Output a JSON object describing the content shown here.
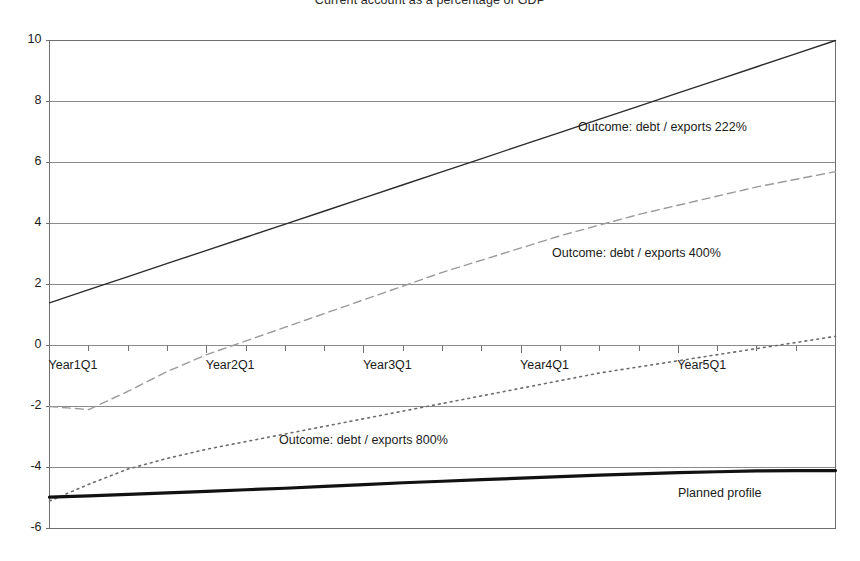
{
  "chart_data": {
    "type": "line",
    "title": "Current account as a percentage of GDP",
    "xlabel": "",
    "ylabel": "",
    "ylim": [
      -6,
      10
    ],
    "yticks": [
      10,
      8,
      6,
      4,
      2,
      0,
      -2,
      -4,
      -6
    ],
    "ytick_labels": [
      "10",
      "8",
      "6",
      "4",
      "2",
      "0",
      "-2",
      "-4",
      "-6"
    ],
    "xlim": [
      0,
      20
    ],
    "xticks": [
      0,
      4,
      8,
      12,
      16
    ],
    "xtick_labels": [
      "Year1Q1",
      "Year2Q1",
      "Year3Q1",
      "Year4Q1",
      "Year5Q1"
    ],
    "grid": "horizontal",
    "legend_position": "inline-annotations",
    "minor_xticks_per_year": 4,
    "series": [
      {
        "name": "Outcome: debt / exports 222%",
        "style": "solid",
        "color": "#2b2b2b",
        "width": 1.4,
        "annotation": "Outcome: debt / exports 222%",
        "x": [
          0,
          1,
          2,
          3,
          4,
          5,
          6,
          7,
          8,
          9,
          10,
          11,
          12,
          13,
          14,
          15,
          16,
          17,
          18,
          19,
          20
        ],
        "values": [
          1.4,
          1.83,
          2.26,
          2.69,
          3.12,
          3.55,
          3.98,
          4.41,
          4.84,
          5.27,
          5.7,
          6.13,
          6.56,
          6.99,
          7.42,
          7.85,
          8.28,
          8.71,
          9.14,
          9.57,
          10.0
        ]
      },
      {
        "name": "Outcome: debt / exports 400%",
        "style": "dashed",
        "color": "#9a9a9a",
        "width": 1.4,
        "annotation": "Outcome: debt / exports 400%",
        "x": [
          0,
          1,
          2,
          3,
          4,
          5,
          6,
          7,
          8,
          9,
          10,
          11,
          12,
          13,
          14,
          15,
          16,
          17,
          18,
          19,
          20
        ],
        "values": [
          -2.0,
          -2.1,
          -1.5,
          -0.85,
          -0.3,
          0.15,
          0.6,
          1.05,
          1.5,
          1.95,
          2.4,
          2.8,
          3.2,
          3.6,
          3.95,
          4.3,
          4.6,
          4.9,
          5.2,
          5.45,
          5.7
        ]
      },
      {
        "name": "Outcome: debt / exports 800%",
        "style": "dotted",
        "color": "#6d6d6d",
        "width": 1.6,
        "annotation": "Outcome: debt / exports 800%",
        "x": [
          0,
          1,
          2,
          3,
          4,
          5,
          6,
          7,
          8,
          9,
          10,
          11,
          12,
          13,
          14,
          15,
          16,
          17,
          18,
          19,
          20
        ],
        "values": [
          -5.1,
          -4.55,
          -4.05,
          -3.7,
          -3.4,
          -3.15,
          -2.9,
          -2.65,
          -2.4,
          -2.15,
          -1.9,
          -1.65,
          -1.4,
          -1.15,
          -0.9,
          -0.7,
          -0.5,
          -0.3,
          -0.1,
          0.1,
          0.3
        ]
      },
      {
        "name": "Planned profile",
        "style": "solid-thick",
        "color": "#111111",
        "width": 3.2,
        "annotation": "Planned profile",
        "x": [
          0,
          1,
          2,
          3,
          4,
          5,
          6,
          7,
          8,
          9,
          10,
          11,
          12,
          13,
          14,
          15,
          16,
          17,
          18,
          19,
          20
        ],
        "values": [
          -4.97,
          -4.93,
          -4.88,
          -4.83,
          -4.78,
          -4.73,
          -4.68,
          -4.62,
          -4.56,
          -4.5,
          -4.45,
          -4.4,
          -4.35,
          -4.3,
          -4.25,
          -4.21,
          -4.17,
          -4.14,
          -4.11,
          -4.1,
          -4.1
        ]
      }
    ],
    "annotations": [
      {
        "text": "Outcome: debt / exports 222%",
        "x_px": 578,
        "y_px": 120
      },
      {
        "text": "Outcome: debt / exports 400%",
        "x_px": 552,
        "y_px": 246
      },
      {
        "text": "Outcome: debt / exports 800%",
        "x_px": 279,
        "y_px": 433
      },
      {
        "text": "Planned profile",
        "x_px": 678,
        "y_px": 486
      }
    ]
  },
  "colors": {
    "background": "#ffffff",
    "frame": "#6f6f6f",
    "gridline": "#8a8a8a",
    "text": "#1b1b1b"
  }
}
